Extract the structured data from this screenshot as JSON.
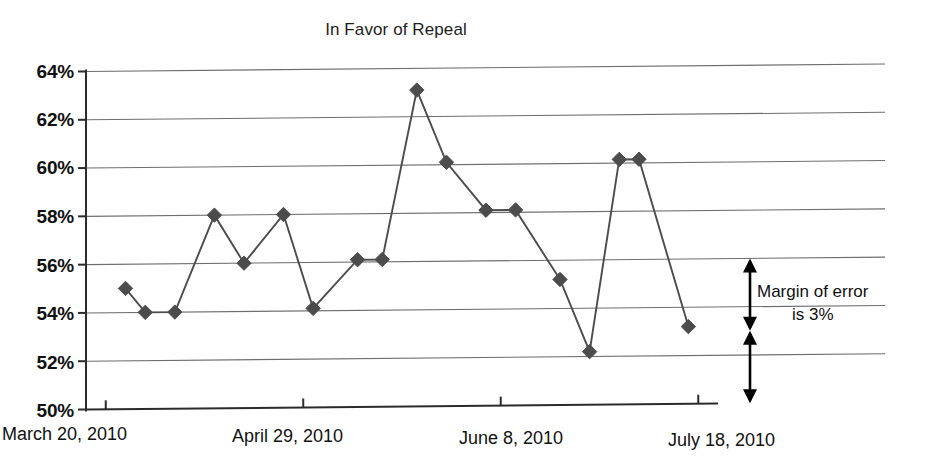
{
  "chart_data": {
    "type": "line",
    "title": "In Favor of Repeal",
    "xlabel": "",
    "ylabel": "",
    "ylim": [
      50,
      64
    ],
    "ytick_values": [
      50,
      52,
      54,
      56,
      58,
      60,
      62,
      64
    ],
    "ytick_labels": [
      "50%",
      "52%",
      "54%",
      "56%",
      "58%",
      "60%",
      "62%",
      "64%"
    ],
    "grid": true,
    "legend": "none",
    "marker": "diamond",
    "marker_color": "#4c4c4c",
    "line_color": "#4c4c4c",
    "xtick_labels": [
      "March 20, 2010",
      "April 29, 2010",
      "June 8, 2010",
      "July 18, 2010"
    ],
    "xtick_positions": [
      0,
      40,
      80,
      120
    ],
    "x_unit": "days since March 20, 2010",
    "xlim": [
      -4,
      124
    ],
    "series": [
      {
        "name": "In Favor of Repeal",
        "x": [
          4,
          8,
          14,
          22,
          28,
          36,
          42,
          51,
          56,
          63,
          69,
          77,
          83,
          92,
          98,
          104,
          108,
          118
        ],
        "values": [
          55.0,
          54.0,
          54.0,
          58.0,
          56.0,
          58.0,
          54.1,
          56.1,
          56.1,
          63.1,
          60.1,
          58.1,
          58.1,
          55.2,
          52.2,
          60.15,
          60.15,
          53.2
        ]
      }
    ],
    "annotations": [
      {
        "name": "margin-of-error",
        "text_line_1": "Margin of error",
        "text_line_2": "is 3%",
        "span_percent": 3,
        "arrow_upper_range": [
          53,
          56
        ],
        "arrow_lower_range": [
          50,
          53
        ]
      }
    ]
  }
}
